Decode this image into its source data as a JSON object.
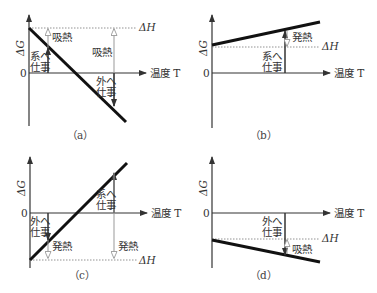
{
  "figure": {
    "panels": [
      {
        "id": "a",
        "caption": "（a）",
        "y_axis_label": "ΔG",
        "x_axis_label": "温度 T",
        "zero_label": "0",
        "delta_h_label": "ΔH",
        "left_work_label_1": "系へ",
        "left_work_label_2": "仕事",
        "left_heat_label": "吸熱",
        "right_heat_label": "吸熱",
        "right_work_label_1": "外へ",
        "right_work_label_2": "仕事"
      },
      {
        "id": "b",
        "caption": "（b）",
        "y_axis_label": "ΔG",
        "x_axis_label": "温度 T",
        "zero_label": "0",
        "delta_h_label": "ΔH",
        "work_label_1": "系へ",
        "work_label_2": "仕事",
        "heat_label": "発熱"
      },
      {
        "id": "c",
        "caption": "（c）",
        "y_axis_label": "ΔG",
        "x_axis_label": "温度 T",
        "zero_label": "0",
        "delta_h_label": "ΔH",
        "left_work_label_1": "外へ",
        "left_work_label_2": "仕事",
        "left_heat_label": "発熱",
        "right_work_label_1": "系へ",
        "right_work_label_2": "仕事",
        "right_heat_label": "発熱"
      },
      {
        "id": "d",
        "caption": "（d）",
        "y_axis_label": "ΔG",
        "x_axis_label": "温度 T",
        "zero_label": "0",
        "delta_h_label": "ΔH",
        "work_label_1": "外へ",
        "work_label_2": "仕事",
        "heat_label": "吸熱"
      }
    ]
  }
}
